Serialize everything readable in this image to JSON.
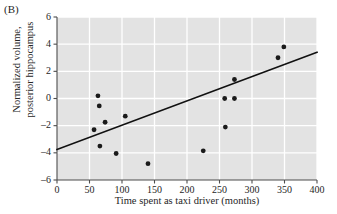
{
  "panel": {
    "label": "(B)"
  },
  "axes": {
    "ylabel_line1": "Normalized volume,",
    "ylabel_line2": "posterior hippocampus",
    "xlabel": "Time spent as taxi driver (months)"
  },
  "style": {
    "plot_background": "#e3e3e3",
    "gridline_color": "#ffffff",
    "axis_color": "#4d4d4d",
    "point_color": "#1a1a1a",
    "line_color": "#111111"
  },
  "chart_data": {
    "type": "scatter",
    "title": "(B)",
    "xlabel": "Time spent as taxi driver (months)",
    "ylabel": "Normalized volume, posterior hippocampus",
    "xlim": [
      0,
      400
    ],
    "ylim": [
      -6,
      6
    ],
    "xticks": [
      0,
      50,
      100,
      150,
      200,
      250,
      300,
      350,
      400
    ],
    "yticks": [
      -6,
      -4,
      -2,
      0,
      2,
      4,
      6
    ],
    "xtick_labels": [
      "0",
      "50",
      "100",
      "150",
      "200",
      "250",
      "300",
      "350",
      "400"
    ],
    "ytick_labels": [
      "-6",
      "-4",
      "-2",
      "0",
      "2",
      "4",
      "6"
    ],
    "grid": true,
    "legend": null,
    "points": [
      {
        "x": 57,
        "y": -2.3
      },
      {
        "x": 63,
        "y": 0.2
      },
      {
        "x": 65,
        "y": -0.55
      },
      {
        "x": 66,
        "y": -3.5
      },
      {
        "x": 74,
        "y": -1.75
      },
      {
        "x": 91,
        "y": -4.05
      },
      {
        "x": 105,
        "y": -1.3
      },
      {
        "x": 140,
        "y": -4.8
      },
      {
        "x": 225,
        "y": -3.85
      },
      {
        "x": 258,
        "y": 0.0
      },
      {
        "x": 259,
        "y": -2.1
      },
      {
        "x": 273,
        "y": 0.0
      },
      {
        "x": 273,
        "y": 1.4
      },
      {
        "x": 340,
        "y": 3.0
      },
      {
        "x": 349,
        "y": 3.8
      }
    ],
    "trendline": {
      "type": "linear-fit",
      "x_start": 0,
      "y_start": -3.75,
      "x_end": 400,
      "y_end": 3.4
    }
  }
}
